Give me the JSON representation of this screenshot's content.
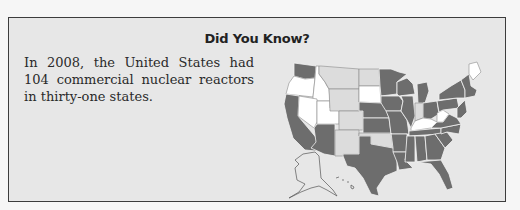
{
  "callout": {
    "title": "Did You Know?",
    "body": "In 2008, the United States had 104 commercial nuclear reactors in thirty-one states."
  },
  "map": {
    "label": "United States map of states with commercial nuclear reactors",
    "legend_colors": {
      "has_reactors": "#6d6d6d",
      "no_reactors_light": "#dcdcdc",
      "no_reactors_white": "#ffffff"
    }
  }
}
